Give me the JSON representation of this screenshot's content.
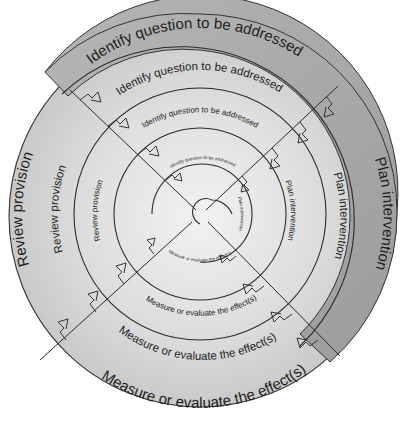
{
  "diagram": {
    "type": "spiral-cycle",
    "center": {
      "x": 200,
      "y": 212
    },
    "colors": {
      "background": "#ffffff",
      "outer_band": "#a9a9a9",
      "disc_light": "#e2e2e2",
      "disc_mid": "#cfcfcf",
      "line": "#2a2a2a",
      "text": "#1e1e1e"
    },
    "stages": [
      "Identify question to be addressed",
      "Plan intervention",
      "Measure or evaluate the effect(s)",
      "Review provision"
    ],
    "rings": [
      {
        "level": 1,
        "identify": "Identify question to be addressed",
        "plan": "Plan intervention",
        "measure": "Measure or evaluate the effect(s)",
        "review": "Review provision"
      },
      {
        "level": 2,
        "identify": "Identify question to be addressed",
        "plan": "Plan intervention",
        "measure": "Measure or evaluate the effect(s)",
        "review": "Review provision"
      },
      {
        "level": 3,
        "identify": "Identify question to be addressed",
        "plan": "Plan intervention",
        "measure": "Measure or evaluate the effect(s)",
        "review": "Review provision"
      },
      {
        "level": 4,
        "identify": "Identify question to be addressed",
        "plan": "Plan intervention",
        "measure": "Measure or evaluate the effect(s)",
        "review": "Review provision"
      }
    ]
  }
}
